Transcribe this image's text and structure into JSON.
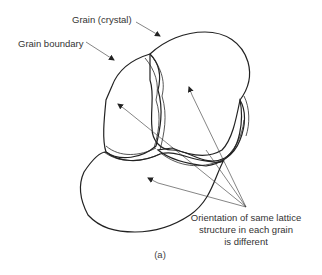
{
  "figure": {
    "caption": "(a)",
    "labels": {
      "grain": "Grain (crystal)",
      "boundary": "Grain boundary",
      "orientation_line1": "Orientation of same lattice",
      "orientation_line2": "structure in each grain",
      "orientation_line3": "is different"
    },
    "grains": [
      {
        "name": "upper-right-grain",
        "lattice_angle_deg": 20
      },
      {
        "name": "upper-left-grain",
        "lattice_angle_deg": -8
      },
      {
        "name": "lower-left-grain",
        "lattice_angle_deg": -25
      },
      {
        "name": "right-small-grain",
        "lattice_angle_deg": 35
      }
    ],
    "colors": {
      "line": "#222222",
      "text": "#333333",
      "background": "#ffffff"
    }
  }
}
